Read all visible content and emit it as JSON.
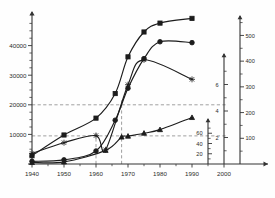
{
  "chart_data": {
    "type": "line",
    "title": "",
    "subtitle": "",
    "xlabel": "",
    "ylabel": "",
    "grid": false,
    "legend_position": "none",
    "x_axis": {
      "name": "year-axis",
      "ticks": [
        1940,
        1950,
        1960,
        1970,
        1980,
        1990,
        2000
      ],
      "tick_labels": [
        "1940",
        "1950",
        "1960",
        "1970",
        "1980",
        "1990",
        "2000"
      ],
      "xlim": [
        1940,
        2005
      ],
      "minor_tick_step": 5
    },
    "y_axes": [
      {
        "name": "primary-left-axis",
        "position": "left",
        "ticks": [
          10000,
          20000,
          30000,
          40000
        ],
        "tick_labels": [
          "10000",
          "20000",
          "30000",
          "40000"
        ],
        "ylim": [
          0,
          50000
        ],
        "minor_tick_step": 2500
      },
      {
        "name": "right-axis-inner",
        "position": "right-inner",
        "ticks": [
          20,
          40,
          60
        ],
        "tick_labels": [
          "20",
          "40",
          "60"
        ],
        "ylim": [
          0,
          80
        ],
        "minor_tick_step": 10
      },
      {
        "name": "right-axis-middle",
        "position": "right-middle",
        "ticks": [
          2,
          4,
          6
        ],
        "tick_labels": [
          "2",
          "4",
          "6"
        ],
        "ylim": [
          0,
          8
        ],
        "minor_tick_step": 1
      },
      {
        "name": "right-axis-outer",
        "position": "right-outer",
        "ticks": [
          100,
          200,
          300,
          400,
          500
        ],
        "tick_labels": [
          "100",
          "200",
          "300",
          "400",
          "500"
        ],
        "ylim": [
          0,
          560
        ],
        "minor_tick_step": 50
      }
    ],
    "reference_lines": [
      {
        "name": "hline-20000",
        "orientation": "horizontal",
        "value": 20000,
        "axis": "primary-left-axis",
        "style": "dashed"
      },
      {
        "name": "hline-10000",
        "orientation": "horizontal",
        "value": 9500,
        "axis": "primary-left-axis",
        "style": "dashed"
      },
      {
        "name": "vline-1960",
        "orientation": "vertical",
        "value": 1960,
        "style": "dashed"
      },
      {
        "name": "vline-1968",
        "orientation": "vertical",
        "value": 1968,
        "style": "dashed"
      }
    ],
    "series": [
      {
        "name": "series-square-upper",
        "marker": "square",
        "axis": "primary-left-axis",
        "x": [
          1940,
          1950,
          1960,
          1966,
          1970,
          1975,
          1980,
          1990
        ],
        "values": [
          2800,
          9800,
          15500,
          23800,
          36200,
          44600,
          47600,
          49200
        ]
      },
      {
        "name": "series-circle-middle",
        "marker": "circle",
        "axis": "primary-left-axis",
        "x": [
          1940,
          1950,
          1960,
          1966,
          1970,
          1975,
          1980,
          1990
        ],
        "values": [
          900,
          1400,
          4400,
          14800,
          25600,
          35600,
          41300,
          41000
        ]
      },
      {
        "name": "series-star-declining",
        "marker": "star",
        "axis": "primary-left-axis",
        "x": [
          1940,
          1950,
          1960,
          1963,
          1970,
          1975,
          1990
        ],
        "values": [
          3600,
          7200,
          9600,
          4800,
          26800,
          35200,
          28600
        ]
      },
      {
        "name": "series-triangle-lower",
        "marker": "triangle",
        "axis": "primary-left-axis",
        "x": [
          1940,
          1950,
          1963,
          1968,
          1970,
          1975,
          1980,
          1990
        ],
        "values": [
          500,
          700,
          4600,
          9100,
          9400,
          10400,
          11600,
          15700
        ]
      }
    ]
  }
}
